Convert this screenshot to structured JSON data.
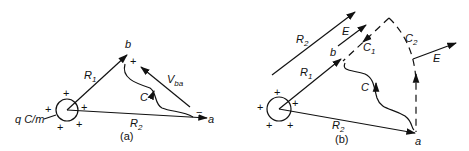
{
  "figure": {
    "panels": [
      {
        "id": "a",
        "caption": "(a)",
        "labels": {
          "point_b": "b",
          "point_a": "a",
          "R1": "R",
          "R1_sub": "1",
          "R2": "R",
          "R2_sub": "2",
          "V": "V",
          "V_sub": "ba",
          "path_C": "C",
          "charge_density": "q C/m",
          "plus": "+",
          "minus": "−"
        }
      },
      {
        "id": "b",
        "caption": "(b)",
        "labels": {
          "point_b": "b",
          "point_a": "a",
          "R1": "R",
          "R1_sub": "1",
          "R2_inner": "R",
          "R2_inner_sub": "2",
          "R2_outer": "R",
          "R2_outer_sub": "2",
          "E_upper": "E",
          "E_right": "E",
          "path_C": "C",
          "path_C1": "C",
          "path_C1_sub": "1",
          "path_C2": "C",
          "path_C2_sub": "2",
          "plus": "+"
        }
      }
    ],
    "colors": {
      "ink": "#111111",
      "background": "#ffffff"
    }
  }
}
